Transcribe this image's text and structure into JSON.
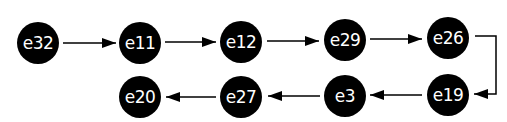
{
  "diagram": {
    "type": "linked-chain",
    "nodes": [
      {
        "id": "e32",
        "label": "e32",
        "x": 38,
        "y": 43
      },
      {
        "id": "e11",
        "label": "e11",
        "x": 140,
        "y": 43
      },
      {
        "id": "e12",
        "label": "e12",
        "x": 241,
        "y": 43
      },
      {
        "id": "e29",
        "label": "e29",
        "x": 345,
        "y": 41
      },
      {
        "id": "e26",
        "label": "e26",
        "x": 448,
        "y": 40
      },
      {
        "id": "e19",
        "label": "e19",
        "x": 448,
        "y": 95
      },
      {
        "id": "e3",
        "label": "e3",
        "x": 345,
        "y": 96
      },
      {
        "id": "e27",
        "label": "e27",
        "x": 241,
        "y": 97
      },
      {
        "id": "e20",
        "label": "e20",
        "x": 140,
        "y": 97
      }
    ],
    "edges": [
      {
        "from": "e32",
        "to": "e11"
      },
      {
        "from": "e11",
        "to": "e12"
      },
      {
        "from": "e12",
        "to": "e29"
      },
      {
        "from": "e29",
        "to": "e26"
      },
      {
        "from": "e26",
        "to": "e19"
      },
      {
        "from": "e19",
        "to": "e3"
      },
      {
        "from": "e3",
        "to": "e27"
      },
      {
        "from": "e27",
        "to": "e20"
      }
    ],
    "colors": {
      "node_fill": "#000000",
      "node_text": "#ffffff",
      "edge": "#000000"
    }
  }
}
